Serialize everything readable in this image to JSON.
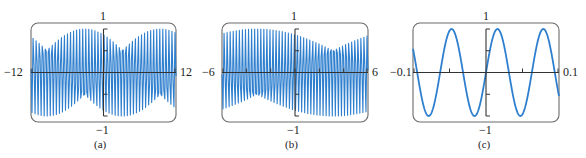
{
  "figure": {
    "panels": [
      {
        "caption": "(a)",
        "xmin_label": "−12",
        "xmax_label": "12",
        "ymax_label": "1",
        "ymin_label": "−1"
      },
      {
        "caption": "(b)",
        "xmin_label": "−6",
        "xmax_label": "6",
        "ymax_label": "1",
        "ymin_label": "−1"
      },
      {
        "caption": "(c)",
        "xmin_label": "−0.1",
        "xmax_label": "0.1",
        "ymax_label": "1",
        "ymin_label": "−1"
      }
    ],
    "colors": {
      "curve": "#2f7fcf",
      "axis": "#333333",
      "frame": "#6b6b6b"
    }
  },
  "chart_data": [
    {
      "type": "line",
      "title": "(a)",
      "function": "y = sin(100x)",
      "xlim": [
        -12,
        12
      ],
      "ylim": [
        -1,
        1
      ],
      "x_ticks": [],
      "y_ticks": [
        -0.5,
        0.5
      ],
      "samples": 143,
      "note": "aliased appearance due to coarse sampling",
      "grid": false,
      "legend": null
    },
    {
      "type": "line",
      "title": "(b)",
      "function": "y = sin(100x)",
      "xlim": [
        -6,
        6
      ],
      "ylim": [
        -1,
        1
      ],
      "x_ticks": [
        -4,
        -2,
        0,
        2,
        4
      ],
      "y_ticks": [
        -0.5,
        0.5
      ],
      "samples": 143,
      "note": "aliased appearance due to coarse sampling",
      "grid": false,
      "legend": null
    },
    {
      "type": "line",
      "title": "(c)",
      "function": "y = sin(100x)",
      "xlim": [
        -0.1,
        0.1
      ],
      "ylim": [
        -1,
        1
      ],
      "x_ticks": [
        -0.05,
        0.05
      ],
      "y_ticks": [
        -0.5,
        0.5
      ],
      "samples": 400,
      "grid": false,
      "legend": null
    }
  ]
}
